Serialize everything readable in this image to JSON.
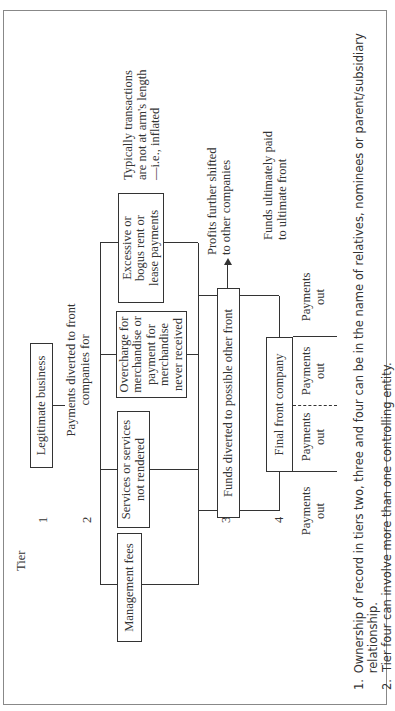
{
  "tiers": {
    "header": "Tier",
    "labels": [
      "1",
      "2",
      "3",
      "4"
    ]
  },
  "tier1": {
    "box": "Legitimate business",
    "edge_label": "Payments diverted to front companies for"
  },
  "tier2": {
    "boxes": [
      "Management fees",
      "Services or services not rendered",
      "Overcharge for merchandise or payment for merchandise never received",
      "Excessive or bogus rent or lease payments"
    ],
    "annotation": "Typically transactions are not at arm's length—i.e., inflated"
  },
  "tier3": {
    "box": "Funds diverted to possible other front",
    "arrow_label": "Profits further shifted to other companies"
  },
  "tier4": {
    "annotation": "Funds ultimately paid to ultimate front",
    "box": "Final front company",
    "payments": [
      "Payments out",
      "Payments out",
      "Payments out",
      "Payments out"
    ]
  },
  "footnotes": [
    {
      "num": "1.",
      "text": "Ownership of record in tiers two, three and four can be in the name of relatives, nominees or parent/subsidiary relationship."
    },
    {
      "num": "2.",
      "text": "Tier four can involve more than one controlling entity."
    }
  ]
}
